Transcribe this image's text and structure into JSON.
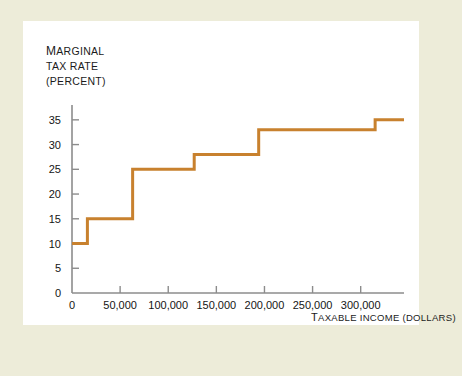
{
  "figure": {
    "background_color": "#edecd9",
    "card_color": "#ffffff",
    "rule_color": "#2b4a71"
  },
  "axis_titles": {
    "y_line1": "MARGINAL",
    "y_line1_lead": "M",
    "y_line1_rest": "ARGINAL",
    "y_line2": "TAX RATE",
    "y_line3": "(PERCENT)",
    "x_lead": "T",
    "x_rest": "AXABLE INCOME (DOLLARS)"
  },
  "chart_data": {
    "type": "line",
    "subtype": "step",
    "title": "",
    "xlabel": "TAXABLE INCOME (DOLLARS)",
    "ylabel": "MARGINAL TAX RATE (PERCENT)",
    "xlim": [
      0,
      345000
    ],
    "ylim": [
      0,
      38
    ],
    "grid": false,
    "legend": false,
    "line_color": "#c8812e",
    "line_width": 3,
    "axis_color": "#8c8c8c",
    "xticks": [
      0,
      50000,
      100000,
      150000,
      200000,
      250000,
      300000
    ],
    "xtick_labels": [
      "0",
      "50,000",
      "100,000",
      "150,000",
      "200,000",
      "250,000",
      "300,000"
    ],
    "yticks": [
      0,
      5,
      10,
      15,
      20,
      25,
      30,
      35
    ],
    "ytick_labels": [
      "0",
      "5",
      "10",
      "15",
      "20",
      "25",
      "30",
      "35"
    ],
    "brackets": [
      {
        "lower": 0,
        "upper": 16000,
        "rate": 10
      },
      {
        "lower": 16000,
        "upper": 63000,
        "rate": 15
      },
      {
        "lower": 63000,
        "upper": 127000,
        "rate": 25
      },
      {
        "lower": 127000,
        "upper": 194000,
        "rate": 28
      },
      {
        "lower": 194000,
        "upper": 315000,
        "rate": 33
      },
      {
        "lower": 315000,
        "upper": 345000,
        "rate": 35
      }
    ],
    "x": [
      0,
      16000,
      16000,
      63000,
      63000,
      127000,
      127000,
      194000,
      194000,
      315000,
      315000,
      345000
    ],
    "y": [
      10,
      10,
      15,
      15,
      25,
      25,
      28,
      28,
      33,
      33,
      35,
      35
    ]
  }
}
